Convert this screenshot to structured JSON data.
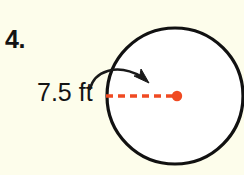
{
  "figure": {
    "problem_number": "4.",
    "radius_label": "7.5 ft",
    "background_color": "#fdfdeb",
    "shape": {
      "name": "circle",
      "stroke_color": "#111111",
      "fill_color": "#ffffff",
      "center_x": 175,
      "center_y": 96,
      "radius_px": 68
    },
    "radius_line": {
      "color": "#f04a22",
      "style": "dashed",
      "from_x": 106,
      "to_x": 177,
      "y": 96
    },
    "center_point": {
      "color": "#f04a22",
      "radius_px": 5
    },
    "pointer_arrow": {
      "color": "#1a1a1a",
      "start_x": 90,
      "start_y": 89,
      "tip_x": 148,
      "tip_y": 83
    }
  }
}
